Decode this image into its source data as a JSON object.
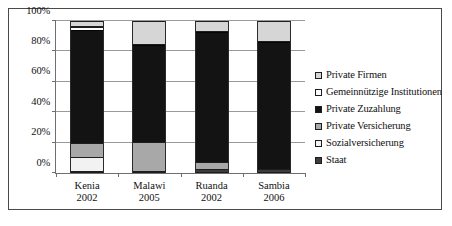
{
  "chart_data": {
    "type": "bar",
    "subtype": "100% stacked column",
    "title": "",
    "xlabel": "",
    "ylabel": "",
    "ylim": [
      0,
      100
    ],
    "ytick_labels": [
      "0%",
      "20%",
      "40%",
      "60%",
      "80%",
      "100%"
    ],
    "ytick_values": [
      0,
      20,
      40,
      60,
      80,
      100
    ],
    "grid": true,
    "legend_position": "right",
    "categories": [
      "Kenia\n2002",
      "Malawi\n2005",
      "Ruanda\n2002",
      "Sambia\n2006"
    ],
    "category_lines": [
      {
        "country": "Kenia",
        "year": "2002"
      },
      {
        "country": "Malawi",
        "year": "2005"
      },
      {
        "country": "Ruanda",
        "year": "2002"
      },
      {
        "country": "Sambia",
        "year": "2006"
      }
    ],
    "series": [
      {
        "name": "Staat",
        "swatch": "dark-gray",
        "color": "#3c3c3c",
        "values": [
          1.5,
          1.5,
          2.5,
          2.5
        ]
      },
      {
        "name": "Sozialversicherung",
        "swatch": "white",
        "color": "#f2f2f2",
        "values": [
          9.0,
          0.0,
          0.0,
          0.0
        ]
      },
      {
        "name": "Private Versicherung",
        "swatch": "medium-gray",
        "color": "#a8a8a8",
        "values": [
          9.5,
          19.0,
          5.0,
          0.0
        ]
      },
      {
        "name": "Private Zuzahlung",
        "swatch": "black",
        "color": "#131313",
        "values": [
          74.0,
          64.0,
          85.0,
          84.0
        ]
      },
      {
        "name": "Gemeinnützige Institutionen",
        "swatch": "white",
        "color": "#fdfdfd",
        "values": [
          2.0,
          0.0,
          0.0,
          0.0
        ]
      },
      {
        "name": "Private Firmen",
        "swatch": "light-gray",
        "color": "#d6d6d6",
        "values": [
          4.0,
          15.5,
          7.5,
          13.5
        ]
      }
    ],
    "legend_entries": [
      "Private Firmen",
      "Gemeinnützige Institutionen",
      "Private Zuzahlung",
      "Private Versicherung",
      "Sozialversicherung",
      "Staat"
    ],
    "stack_order_bottom_to_top": [
      "Staat",
      "Sozialversicherung",
      "Private Versicherung",
      "Private Zuzahlung",
      "Gemeinnützige Institutionen",
      "Private Firmen"
    ]
  }
}
